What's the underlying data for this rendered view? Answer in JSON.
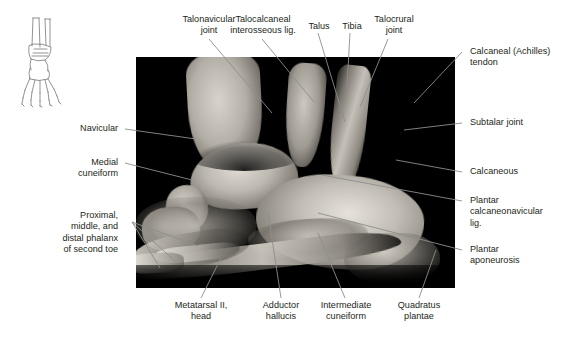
{
  "figure": {
    "type": "anatomical-photograph",
    "view": "sagittal section of foot and ankle",
    "inset_name": "foot-orientation-diagram",
    "photo_name": "sagittal-foot-section-photograph"
  },
  "labels": {
    "top": [
      {
        "id": "talonavicular-joint",
        "text": "Talonavicular\njoint"
      },
      {
        "id": "talocalcaneal-interosseous-lig",
        "text": "Talocalcaneal\ninterosseous lig."
      },
      {
        "id": "talus",
        "text": "Talus"
      },
      {
        "id": "tibia",
        "text": "Tibia"
      },
      {
        "id": "talocrural-joint",
        "text": "Talocrural\njoint"
      }
    ],
    "right": [
      {
        "id": "calcaneal-achilles-tendon",
        "text": "Calcaneal (Achilles)\ntendon"
      },
      {
        "id": "subtalar-joint",
        "text": "Subtalar joint"
      },
      {
        "id": "calcaneous",
        "text": "Calcaneous"
      },
      {
        "id": "plantar-calcaneonavicular-lig",
        "text": "Plantar\ncalcaneonavicular\nlig."
      },
      {
        "id": "plantar-aponeurosis",
        "text": "Plantar\naponeurosis"
      }
    ],
    "left": [
      {
        "id": "navicular",
        "text": "Navicular"
      },
      {
        "id": "medial-cuneiform",
        "text": "Medial\ncuneiform"
      },
      {
        "id": "phalanges-second-toe",
        "text": "Proximal,\nmiddle, and\ndistal phalanx\nof second toe"
      }
    ],
    "bottom": [
      {
        "id": "metatarsal-ii-head",
        "text": "Metatarsal II,\nhead"
      },
      {
        "id": "adductor-hallucis",
        "text": "Adductor\nhallucis"
      },
      {
        "id": "intermediate-cuneiform",
        "text": "Intermediate\ncuneiform"
      },
      {
        "id": "quadratus-plantae",
        "text": "Quadratus\nplantae"
      }
    ]
  },
  "caption": {
    "text": ""
  },
  "colors": {
    "leader_line": "#8d8d8d",
    "label_text": "#231f20",
    "photo_background": "#000000",
    "page_background": "#ffffff"
  }
}
